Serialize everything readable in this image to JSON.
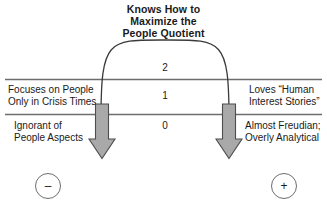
{
  "diagram": {
    "title": "Knows How to\nMaximize the\nPeople Quotient",
    "scale_numbers": {
      "top": "2",
      "middle": "1",
      "bottom": "0"
    },
    "labels": {
      "top_left": "Focuses on People\nOnly in Crisis Times",
      "bottom_left": "Ignorant of\nPeople Aspects",
      "top_right": "Loves “Human\nInterest Stories”",
      "bottom_right": "Almost Freudian;\nOverly Analytical"
    },
    "poles": {
      "negative": "–",
      "positive": "+"
    },
    "colors": {
      "line": "#6d6d6d",
      "arrow_fill": "#a9a9a9",
      "arrow_stroke": "#4d4d4d",
      "arc_stroke": "#3a3a3a",
      "text": "#1a1a1a",
      "background": "#ffffff"
    },
    "icons": {
      "left_arrow": "down-arrow-icon",
      "right_arrow": "down-arrow-icon",
      "arc": "inverted-u-curve"
    }
  }
}
